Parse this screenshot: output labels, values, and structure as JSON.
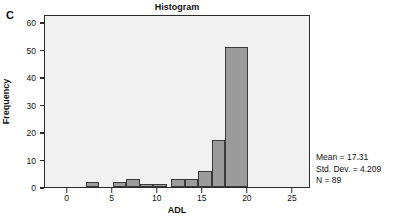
{
  "panel_letter": "C",
  "chart_data": {
    "type": "bar",
    "title": "Histogram",
    "xlabel": "ADL",
    "ylabel": "Frequency",
    "xlim": [
      -2.5,
      27
    ],
    "ylim": [
      0,
      63
    ],
    "grid": false,
    "legend": null,
    "bar_color": "#9b9b9b",
    "bar_edge_color": "#3a3a3a",
    "plot_background": "#f1f1f1",
    "xticks": [
      0,
      5,
      10,
      15,
      20,
      25
    ],
    "xtick_labels": [
      "0",
      "5",
      "10",
      "15",
      "20",
      "25"
    ],
    "yticks": [
      0,
      10,
      20,
      30,
      40,
      50,
      60
    ],
    "ytick_labels": [
      "0",
      "10",
      "20",
      "30",
      "40",
      "50",
      "60"
    ],
    "bins": [
      {
        "start": 2.0,
        "end": 3.5,
        "value": 2
      },
      {
        "start": 5.0,
        "end": 6.5,
        "value": 2
      },
      {
        "start": 6.5,
        "end": 8.0,
        "value": 3
      },
      {
        "start": 8.0,
        "end": 9.5,
        "value": 1
      },
      {
        "start": 9.5,
        "end": 11.0,
        "value": 1
      },
      {
        "start": 11.5,
        "end": 13.0,
        "value": 3
      },
      {
        "start": 13.0,
        "end": 14.5,
        "value": 3
      },
      {
        "start": 14.5,
        "end": 16.0,
        "value": 6
      },
      {
        "start": 16.0,
        "end": 17.5,
        "value": 17
      },
      {
        "start": 17.5,
        "end": 20.0,
        "value": 51
      }
    ],
    "annotations": {
      "mean": "Mean = 17.31",
      "std_dev": "Std. Dev. = 4.209",
      "n": "N = 89"
    }
  }
}
